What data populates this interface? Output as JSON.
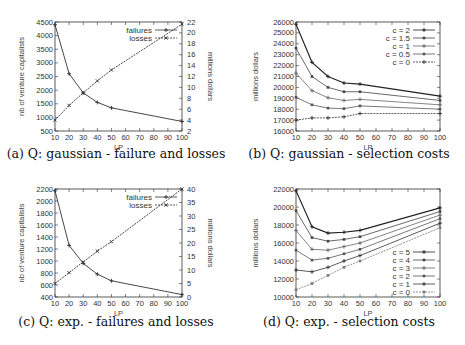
{
  "chart_data": [
    {
      "id": "a",
      "type": "line",
      "title": "(a) Q: gaussian - failure and losses",
      "xlabel": "LP",
      "ylabel": "nb of venture capitalists",
      "y2label": "millions dollars",
      "x": [
        10,
        20,
        30,
        40,
        50,
        100
      ],
      "xlim": [
        10,
        100
      ],
      "xticks": [
        10,
        20,
        30,
        40,
        50,
        60,
        70,
        80,
        90,
        100
      ],
      "ylim": [
        500,
        4500
      ],
      "yticks": [
        500,
        1000,
        1500,
        2000,
        2500,
        3000,
        3500,
        4000,
        4500
      ],
      "y2lim": [
        2,
        22
      ],
      "y2ticks": [
        2,
        4,
        6,
        8,
        10,
        12,
        14,
        16,
        18,
        20,
        22
      ],
      "legend_position": "top-right",
      "grid": false,
      "series": [
        {
          "name": "failures",
          "axis": "y",
          "marker": "+",
          "values": [
            4400,
            2600,
            1900,
            1550,
            1350,
            850
          ]
        },
        {
          "name": "losses",
          "axis": "y2",
          "marker": "x",
          "dashed": true,
          "values": [
            4.0,
            6.7,
            9.0,
            11.2,
            13.2,
            21.6
          ]
        }
      ]
    },
    {
      "id": "b",
      "type": "line",
      "title": "(b) Q: gaussian - selection costs",
      "xlabel": "LP",
      "ylabel": "millions dollars",
      "x": [
        10,
        20,
        30,
        40,
        50,
        100
      ],
      "xlim": [
        10,
        100
      ],
      "xticks": [
        10,
        20,
        30,
        40,
        50,
        60,
        70,
        80,
        90,
        100
      ],
      "ylim": [
        16000,
        26000
      ],
      "yticks": [
        16000,
        17000,
        18000,
        19000,
        20000,
        21000,
        22000,
        23000,
        24000,
        25000,
        26000
      ],
      "legend_position": "top-right",
      "grid": false,
      "series": [
        {
          "name": "c = 2",
          "values": [
            25800,
            22300,
            21000,
            20400,
            20300,
            19200
          ]
        },
        {
          "name": "c = 1.5",
          "values": [
            23600,
            21000,
            20000,
            19600,
            19600,
            18800
          ]
        },
        {
          "name": "c = 1",
          "values": [
            21300,
            19700,
            19050,
            18800,
            18900,
            18400
          ]
        },
        {
          "name": "c = 0.5",
          "values": [
            19100,
            18400,
            18100,
            18050,
            18300,
            18000
          ]
        },
        {
          "name": "c = 0",
          "values": [
            17000,
            17200,
            17200,
            17300,
            17600,
            17600
          ]
        }
      ]
    },
    {
      "id": "c",
      "type": "line",
      "title": "(c) Q: exp. - failures and losses",
      "xlabel": "LP",
      "ylabel": "nb of venture capitalists",
      "y2label": "millions dollars",
      "x": [
        10,
        20,
        30,
        40,
        50,
        100
      ],
      "xlim": [
        10,
        100
      ],
      "xticks": [
        10,
        20,
        30,
        40,
        50,
        60,
        70,
        80,
        90,
        100
      ],
      "ylim": [
        400,
        2200
      ],
      "yticks": [
        400,
        600,
        800,
        1000,
        1200,
        1400,
        1600,
        1800,
        2000,
        2200
      ],
      "y2lim": [
        0,
        40
      ],
      "y2ticks": [
        0,
        5,
        10,
        15,
        20,
        25,
        30,
        35,
        40
      ],
      "legend_position": "top-right",
      "grid": false,
      "series": [
        {
          "name": "failures",
          "axis": "y",
          "marker": "+",
          "values": [
            2170,
            1260,
            960,
            780,
            670,
            440
          ]
        },
        {
          "name": "losses",
          "axis": "y2",
          "marker": "x",
          "dashed": true,
          "values": [
            5,
            9,
            13,
            17,
            20.5,
            40
          ]
        }
      ]
    },
    {
      "id": "d",
      "type": "line",
      "title": "(d) Q: exp. - selection costs",
      "xlabel": "LP",
      "ylabel": "millions dollars",
      "x": [
        10,
        20,
        30,
        40,
        50,
        100
      ],
      "xlim": [
        10,
        100
      ],
      "xticks": [
        10,
        20,
        30,
        40,
        50,
        60,
        70,
        80,
        90,
        100
      ],
      "ylim": [
        10000,
        22000
      ],
      "yticks": [
        10000,
        12000,
        14000,
        16000,
        18000,
        20000,
        22000
      ],
      "legend_position": "bottom-right",
      "grid": false,
      "series": [
        {
          "name": "c = 5",
          "values": [
            21800,
            17800,
            17100,
            17200,
            17400,
            19900
          ]
        },
        {
          "name": "c = 4",
          "values": [
            19600,
            16600,
            16200,
            16400,
            16700,
            19500
          ]
        },
        {
          "name": "c = 3",
          "values": [
            17400,
            15300,
            15200,
            15600,
            16000,
            19100
          ]
        },
        {
          "name": "c = 2",
          "values": [
            15200,
            14100,
            14300,
            14800,
            15300,
            18700
          ]
        },
        {
          "name": "c = 1",
          "values": [
            13000,
            12800,
            13300,
            14000,
            14600,
            18200
          ]
        },
        {
          "name": "c = 0",
          "values": [
            10800,
            11500,
            12400,
            13300,
            14000,
            17700
          ]
        }
      ]
    }
  ],
  "panels": {
    "a": {
      "caption": "(a) Q: gaussian - failure and losses",
      "xlabel": "LP",
      "ylabel": "nb of venture capitalists",
      "y2label": "millions dollars",
      "legend": [
        "failures",
        "losses"
      ]
    },
    "b": {
      "caption": "(b) Q: gaussian - selection costs",
      "xlabel": "LP",
      "ylabel": "millions dollars",
      "legend": [
        "c = 2",
        "c = 1.5",
        "c = 1",
        "c = 0.5",
        "c = 0"
      ]
    },
    "c": {
      "caption": "(c) Q: exp. - failures and losses",
      "xlabel": "LP",
      "ylabel": "nb of venture capitalists",
      "y2label": "millions dollars",
      "legend": [
        "failures",
        "losses"
      ]
    },
    "d": {
      "caption": "(d) Q: exp. - selection costs",
      "xlabel": "LP",
      "ylabel": "millions dollars",
      "legend": [
        "c = 5",
        "c = 4",
        "c = 3",
        "c = 2",
        "c = 1",
        "c = 0"
      ]
    }
  }
}
